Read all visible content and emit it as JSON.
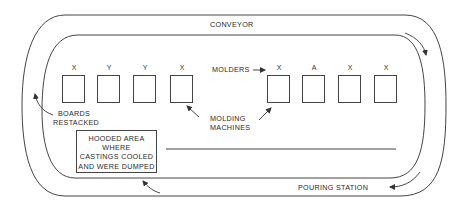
{
  "conveyor": {
    "label": "CONVEYOR"
  },
  "molders": {
    "label": "MOLDERS",
    "left_group": [
      {
        "mark": "X"
      },
      {
        "mark": "Y"
      },
      {
        "mark": "Y"
      },
      {
        "mark": "X"
      }
    ],
    "right_group": [
      {
        "mark": "X"
      },
      {
        "mark": "A"
      },
      {
        "mark": "X"
      },
      {
        "mark": "X"
      }
    ]
  },
  "molding_machines": {
    "line1": "MOLDING",
    "line2": "MACHINES"
  },
  "boards_restacked": {
    "line1": "BOARDS",
    "line2": "RESTACKED"
  },
  "hooded_area": {
    "lines": [
      "HOODED AREA",
      "WHERE",
      "CASTINGS COOLED",
      "AND WERE DUMPED"
    ]
  },
  "pouring_station": {
    "label": "POURING STATION"
  },
  "colors": {
    "line": "#444444",
    "text": "#2a2a2a",
    "background": "#ffffff"
  }
}
